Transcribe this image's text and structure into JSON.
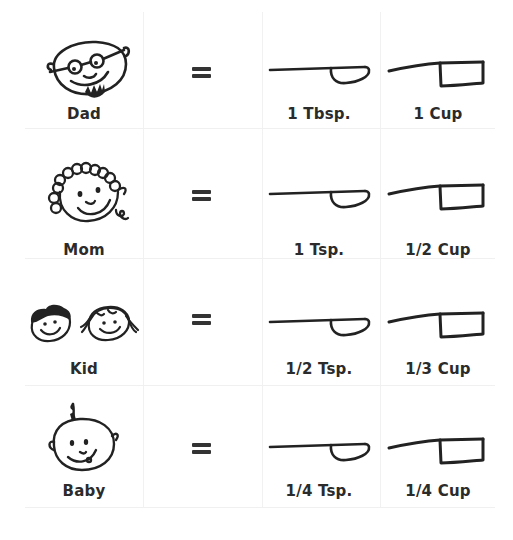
{
  "chart": {
    "rows": [
      {
        "person": "Dad",
        "face_icon": "dad-face-icon",
        "equals": "=",
        "spoon_measure": "1 Tbsp.",
        "cup_measure": "1 Cup"
      },
      {
        "person": "Mom",
        "face_icon": "mom-face-icon",
        "equals": "=",
        "spoon_measure": "1 Tsp.",
        "cup_measure": "1/2 Cup"
      },
      {
        "person": "Kid",
        "face_icon": "kid-faces-icon",
        "equals": "=",
        "spoon_measure": "1/2 Tsp.",
        "cup_measure": "1/3 Cup"
      },
      {
        "person": "Baby",
        "face_icon": "baby-face-icon",
        "equals": "=",
        "spoon_measure": "1/4 Tsp.",
        "cup_measure": "1/4 Cup"
      }
    ]
  },
  "colors": {
    "ink": "#222222",
    "text": "#2b2b2b",
    "grid": "#f0f0f0",
    "background": "#ffffff"
  }
}
